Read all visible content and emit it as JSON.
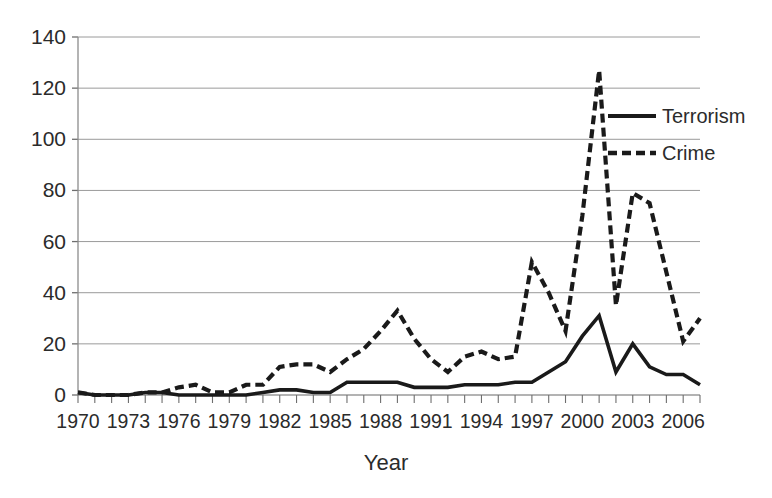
{
  "chart_data": {
    "type": "line",
    "title": "",
    "xlabel": "Year",
    "ylabel": "",
    "xlim": [
      1970,
      2007
    ],
    "ylim": [
      0,
      140
    ],
    "ytick_step": 20,
    "xtick_step": 3,
    "grid": "horizontal",
    "legend_position": "upper-right-inside",
    "yticks": [
      0,
      20,
      40,
      60,
      80,
      100,
      120,
      140
    ],
    "xticks": [
      1970,
      1973,
      1976,
      1979,
      1982,
      1985,
      1988,
      1991,
      1994,
      1997,
      2000,
      2003,
      2006
    ],
    "x": [
      1970,
      1971,
      1972,
      1973,
      1974,
      1975,
      1976,
      1977,
      1978,
      1979,
      1980,
      1981,
      1982,
      1983,
      1984,
      1985,
      1986,
      1987,
      1988,
      1989,
      1990,
      1991,
      1992,
      1993,
      1994,
      1995,
      1996,
      1997,
      1998,
      1999,
      2000,
      2001,
      2002,
      2003,
      2004,
      2005,
      2006,
      2007
    ],
    "series": [
      {
        "name": "Terrorism",
        "style": "solid",
        "color": "#1a1a1a",
        "values": [
          1,
          0,
          0,
          0,
          1,
          1,
          0,
          0,
          0,
          0,
          0,
          1,
          2,
          2,
          1,
          1,
          5,
          5,
          5,
          5,
          3,
          3,
          3,
          4,
          4,
          4,
          5,
          5,
          9,
          13,
          23,
          31,
          9,
          20,
          11,
          8,
          8,
          4
        ]
      },
      {
        "name": "Crime",
        "style": "dashed",
        "color": "#1a1a1a",
        "values": [
          1,
          0,
          0,
          0,
          1,
          1,
          3,
          4,
          1,
          1,
          4,
          4,
          11,
          12,
          12,
          9,
          14,
          18,
          25,
          33,
          22,
          14,
          9,
          15,
          17,
          14,
          15,
          52,
          40,
          25,
          70,
          127,
          35,
          79,
          75,
          48,
          21,
          30
        ]
      }
    ]
  },
  "legend": {
    "items": [
      {
        "label": "Terrorism",
        "style": "solid"
      },
      {
        "label": "Crime",
        "style": "dashed"
      }
    ]
  },
  "axis": {
    "x_title": "Year"
  }
}
